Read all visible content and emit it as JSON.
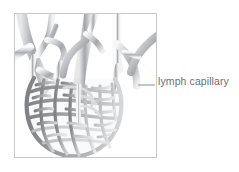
{
  "figure": {
    "frame": {
      "x": 14,
      "y": 13,
      "width": 143,
      "height": 145,
      "border_color": "#c9c9c9",
      "background": "#ffffff"
    },
    "annotation": {
      "label": "lymph capillary",
      "text_color": "#6e7072",
      "leader_line": {
        "color": "#8b8d8f",
        "from_x": 138,
        "from_y": 85,
        "to_x": 155,
        "to_y": 85
      }
    },
    "colors": {
      "vessel_stroke": "#8e9093",
      "vessel_fill_light": "#e8e9ea",
      "vessel_fill_mid": "#c6c8ca",
      "vessel_fill_dark": "#9a9c9f",
      "mesh_dark": "#8a8c8f",
      "mesh_light": "#cfd1d3",
      "background": "#ffffff"
    },
    "structures": [
      {
        "name": "collecting-vessel-upper-left",
        "description": "thick branching lymphatic vessel entering from top-left edge"
      },
      {
        "name": "collecting-vessel-upper-middle",
        "description": "central branching lymphatic vessel descending from top edge"
      },
      {
        "name": "collecting-vessel-upper-right",
        "description": "branching lymphatic vessel entering from top-right edge"
      },
      {
        "name": "capillary-mesh-network",
        "description": "dense honeycomb network of blind-ended lymph capillaries forming the lower bulb"
      }
    ]
  }
}
